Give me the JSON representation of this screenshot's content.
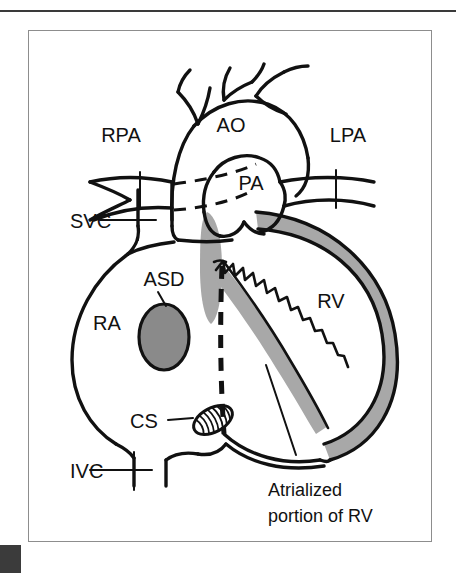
{
  "figure": {
    "background_color": "#ffffff",
    "frame_color": "#8d8d8d",
    "ink_color": "#111111",
    "wall_gray": "#a8a8a8",
    "defect_gray": "#8a8a8a",
    "top_rule_color": "#3a3a3a",
    "corner_mark_color": "#3b3b3b"
  },
  "labels": {
    "rpa": "RPA",
    "ao": "AO",
    "lpa": "LPA",
    "pa": "PA",
    "svc": "SVC",
    "asd": "ASD",
    "ra": "RA",
    "cs": "CS",
    "ivc": "IVC",
    "rv": "RV",
    "atrialized_line1": "Atrialized",
    "atrialized_line2": "portion of RV"
  },
  "structures": [
    {
      "abbr": "RPA",
      "name": "right pulmonary artery"
    },
    {
      "abbr": "AO",
      "name": "aorta"
    },
    {
      "abbr": "LPA",
      "name": "left pulmonary artery"
    },
    {
      "abbr": "PA",
      "name": "pulmonary artery"
    },
    {
      "abbr": "SVC",
      "name": "superior vena cava"
    },
    {
      "abbr": "ASD",
      "name": "atrial septal defect"
    },
    {
      "abbr": "RA",
      "name": "right atrium"
    },
    {
      "abbr": "CS",
      "name": "coronary sinus"
    },
    {
      "abbr": "IVC",
      "name": "inferior vena cava"
    },
    {
      "abbr": "RV",
      "name": "right ventricle"
    }
  ]
}
